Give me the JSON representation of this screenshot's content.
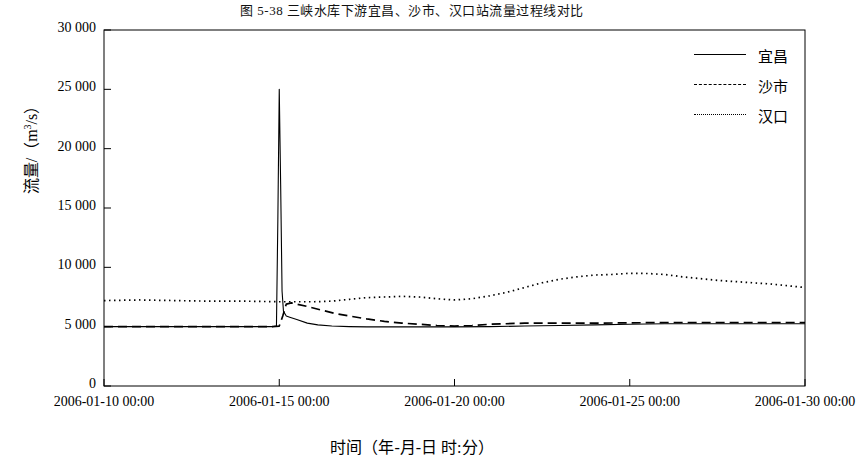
{
  "caption": "图 5-38  三峡水库下游宜昌、沙市、汉口站流量过程线对比",
  "chart_data": {
    "type": "line",
    "title": "",
    "xlabel": "时间（年-月-日 时:分）",
    "ylabel": "流量/（m³/s）",
    "xtick_labels": [
      "2006-01-10 00:00",
      "2006-01-15 00:00",
      "2006-01-20 00:00",
      "2006-01-25 00:00",
      "2006-01-30 00:00"
    ],
    "xtick_values": [
      10,
      15,
      20,
      25,
      30
    ],
    "xlim": [
      10,
      30
    ],
    "ytick_labels": [
      "0",
      "5 000",
      "10 000",
      "15 000",
      "20 000",
      "25 000",
      "30 000"
    ],
    "ytick_values": [
      0,
      5000,
      10000,
      15000,
      20000,
      25000,
      30000
    ],
    "ylim": [
      0,
      30000
    ],
    "grid": false,
    "legend_position": "top-right",
    "series": [
      {
        "name": "宜昌",
        "style": "solid",
        "x": [
          10,
          11,
          12,
          13,
          14,
          14.8,
          14.92,
          14.96,
          15.0,
          15.04,
          15.08,
          15.12,
          15.2,
          15.3,
          15.5,
          15.8,
          16.1,
          16.5,
          17.0,
          17.5,
          18.0,
          19.0,
          20.0,
          21.0,
          22.0,
          23.0,
          24.0,
          25.0,
          26.0,
          27.0,
          28.0,
          29.0,
          30.0
        ],
        "y": [
          5000,
          5000,
          5000,
          5000,
          5000,
          5000,
          5050,
          14000,
          25000,
          17000,
          8000,
          6300,
          5900,
          5800,
          5600,
          5300,
          5150,
          5050,
          5000,
          4980,
          4980,
          4980,
          4980,
          5000,
          5050,
          5100,
          5150,
          5200,
          5250,
          5250,
          5250,
          5250,
          5250
        ]
      },
      {
        "name": "沙市",
        "style": "dashed",
        "x": [
          10,
          11,
          12,
          13,
          14,
          14.8,
          15.0,
          15.1,
          15.2,
          15.35,
          15.5,
          15.8,
          16.2,
          16.6,
          17.0,
          17.5,
          18.0,
          18.5,
          19.0,
          19.5,
          20.0,
          20.5,
          21.0,
          22.0,
          23.0,
          24.0,
          25.0,
          26.0,
          27.0,
          28.0,
          29.0,
          30.0
        ],
        "y": [
          5000,
          5000,
          5000,
          5000,
          5000,
          5000,
          5050,
          5900,
          6900,
          7000,
          6900,
          6700,
          6400,
          6100,
          5900,
          5650,
          5450,
          5300,
          5200,
          5100,
          5050,
          5100,
          5200,
          5300,
          5300,
          5300,
          5320,
          5350,
          5350,
          5350,
          5350,
          5350
        ]
      },
      {
        "name": "汉口",
        "style": "dotted",
        "x": [
          10,
          11,
          12,
          13,
          14,
          15,
          16,
          16.5,
          17,
          17.5,
          18,
          18.5,
          19,
          19.5,
          20,
          20.5,
          21,
          21.5,
          22,
          22.5,
          23,
          23.5,
          24,
          24.5,
          25,
          25.5,
          26,
          26.5,
          27,
          27.5,
          28,
          28.5,
          29,
          29.5,
          30
        ],
        "y": [
          7200,
          7250,
          7200,
          7150,
          7150,
          7100,
          7100,
          7150,
          7300,
          7450,
          7500,
          7550,
          7500,
          7350,
          7250,
          7350,
          7600,
          7900,
          8300,
          8700,
          9000,
          9200,
          9350,
          9400,
          9500,
          9480,
          9400,
          9200,
          9050,
          8900,
          8800,
          8700,
          8600,
          8450,
          8300
        ]
      }
    ]
  }
}
